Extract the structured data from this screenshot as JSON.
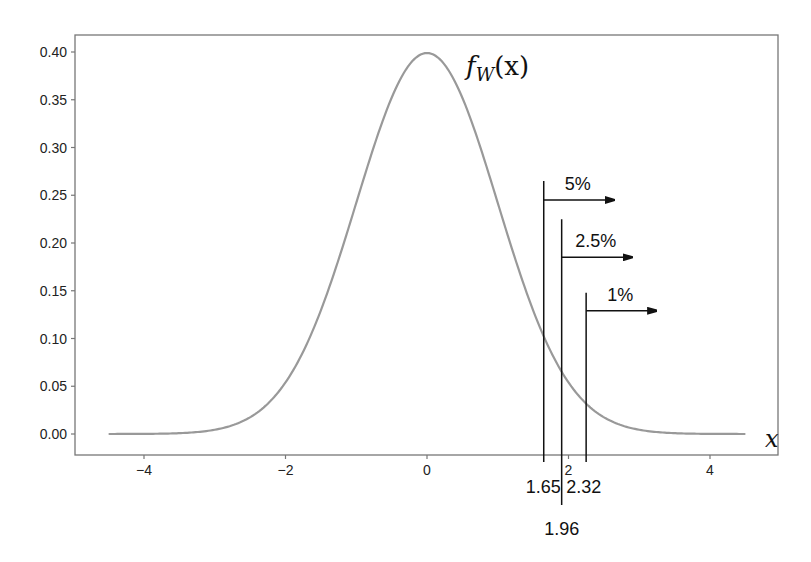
{
  "chart_data": {
    "type": "line",
    "title": "",
    "xlabel": "x",
    "ylabel": "",
    "xlim": [
      -4.75,
      5.2
    ],
    "ylim": [
      -0.02,
      0.42
    ],
    "grid": false,
    "x_ticks": [
      -4,
      -2,
      0,
      2,
      4
    ],
    "x_tick_labels": [
      "−4",
      "−2",
      "0",
      "2",
      "4"
    ],
    "y_ticks": [
      0.0,
      0.05,
      0.1,
      0.15,
      0.2,
      0.25,
      0.3,
      0.35,
      0.4
    ],
    "y_tick_labels": [
      "0.00",
      "0.05",
      "0.10",
      "0.15",
      "0.20",
      "0.25",
      "0.30",
      "0.35",
      "0.40"
    ],
    "series": [
      {
        "name": "f_W(x)",
        "description": "standard normal density",
        "x_range": [
          -4.5,
          4.5
        ],
        "x": [
          -4.5,
          -4,
          -3.5,
          -3,
          -2.5,
          -2,
          -1.5,
          -1,
          -0.5,
          0,
          0.5,
          1,
          1.5,
          2,
          2.5,
          3,
          3.5,
          4,
          4.5
        ],
        "y": [
          0.0,
          0.0001,
          0.0009,
          0.0044,
          0.0175,
          0.054,
          0.1295,
          0.242,
          0.3521,
          0.3989,
          0.3521,
          0.242,
          0.1295,
          0.054,
          0.0175,
          0.0044,
          0.0009,
          0.0001,
          0.0
        ],
        "color": "#999999"
      }
    ],
    "curve_label": {
      "base": "f",
      "sub": "W",
      "arg": "(x)"
    },
    "annotations": [
      {
        "critical_value": 1.65,
        "label": "1.65",
        "tail": "5%",
        "line_top": 0.265,
        "arrow_y": 0.245
      },
      {
        "critical_value": 1.96,
        "label": "1.96",
        "tail": "2.5%",
        "line_top": 0.225,
        "arrow_y": 0.185
      },
      {
        "critical_value": 2.32,
        "label": "2.32",
        "tail": "1%",
        "line_top": 0.148,
        "arrow_y": 0.129
      }
    ],
    "colors": {
      "curve": "#999999",
      "axes": "#777777",
      "annotation": "#111111"
    }
  }
}
